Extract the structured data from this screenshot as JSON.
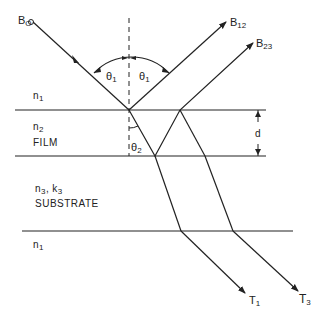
{
  "diagram": {
    "type": "thin-film multiple reflection/transmission ray diagram",
    "labels": {
      "incident_beam": "B",
      "incident_beam_sub": "O",
      "reflected_12": "B",
      "reflected_12_sub": "12",
      "reflected_23": "B",
      "reflected_23_sub": "23",
      "theta1_left": "θ",
      "theta1_left_sub": "1",
      "theta1_right": "θ",
      "theta1_right_sub": "1",
      "theta2": "θ",
      "theta2_sub": "2",
      "medium_top": "n",
      "medium_top_sub": "1",
      "film_index": "n",
      "film_index_sub": "2",
      "film_name": "FILM",
      "substrate_index": "n",
      "substrate_index_sub": "3",
      "substrate_k": "k",
      "substrate_k_sub": "3",
      "substrate_sep": ",",
      "substrate_name": "SUBSTRATE",
      "medium_bottom": "n",
      "medium_bottom_sub": "1",
      "thickness": "d",
      "transmitted_1": "T",
      "transmitted_1_sub": "1",
      "transmitted_3": "T",
      "transmitted_3_sub": "3"
    },
    "interfaces_y": [
      110,
      156,
      231
    ],
    "colors": {
      "line": "#222222",
      "background": "#ffffff"
    }
  }
}
